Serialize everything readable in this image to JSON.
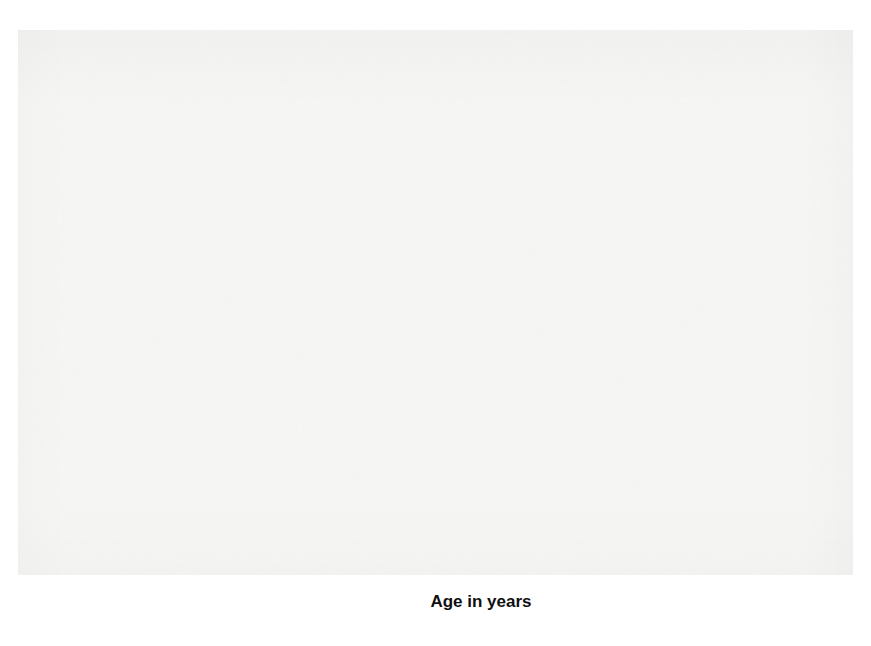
{
  "figure": {
    "background_color": "#f7f7f5",
    "page_color": "#ffffff"
  },
  "axes": {
    "y_title": "Adjusted Binet IQ",
    "x_title": "Age in years",
    "y_ticks": [
      "0",
      "100",
      "110",
      "120",
      "130",
      "140",
      "150",
      "160"
    ],
    "x_ticks": [
      "2",
      "3",
      "4",
      "5",
      "6",
      "7",
      "8",
      "9",
      "10",
      "11",
      "12",
      "13",
      "14",
      "15",
      "16",
      "17"
    ],
    "zero_break_label": "0",
    "gridline_color": "#a7a7a7",
    "axis_color": "#111111"
  },
  "legend": {
    "title": "Group",
    "entries": [
      {
        "label": "4",
        "color": "#555555"
      },
      {
        "label": "5",
        "color": "#8a8a8a"
      },
      {
        "label": "1",
        "color": "#c2c2c2"
      },
      {
        "label": "3",
        "color": "#949494"
      },
      {
        "label": "2",
        "color": "#6e6e6e"
      }
    ]
  },
  "chart_data": {
    "type": "line",
    "title": "",
    "xlabel": "Age in years",
    "ylabel": "Adjusted Binet IQ",
    "xlim": [
      1.6,
      17.4
    ],
    "ylim": [
      96,
      164
    ],
    "grid": true,
    "legend_position": "right",
    "x": [
      2.5,
      3,
      3.5,
      4,
      4.5,
      5,
      5.5,
      6,
      6.5,
      7,
      8,
      9,
      10,
      11,
      12,
      13,
      14,
      15,
      16,
      17
    ],
    "series": [
      {
        "name": "4",
        "label": "4",
        "color": "#555555",
        "x": [
          2.5,
          3,
          3.5,
          4,
          4.5,
          5,
          5.5,
          6,
          6.5,
          7,
          8,
          9,
          10,
          11,
          12,
          13,
          14,
          15,
          16,
          17
        ],
        "values": [
          130,
          134,
          135,
          137.5,
          139.5,
          141,
          136,
          139,
          145.5,
          148,
          154,
          152,
          160,
          154.5,
          150,
          145.5,
          140.5,
          139,
          136.5,
          134
        ]
      },
      {
        "name": "5",
        "label": "5",
        "color": "#8a8a8a",
        "x": [
          2.5,
          3,
          3.5,
          4,
          4.5,
          5,
          5.5,
          6,
          6.5,
          7,
          8,
          9,
          10,
          11,
          12,
          13,
          14,
          15,
          16,
          17
        ],
        "values": [
          112,
          129,
          126.5,
          122.5,
          131,
          121.5,
          128.5,
          126,
          128.5,
          131.5,
          136.5,
          138.5,
          138,
          142.5,
          138,
          137.5,
          137,
          128.5,
          128.5,
          129
        ]
      },
      {
        "name": "1",
        "label": "1",
        "color": "#c2c2c2",
        "x": [
          2.5,
          3,
          3.5,
          4,
          4.5,
          5,
          5.5,
          6,
          6.5,
          7,
          8,
          9,
          10,
          11,
          12,
          13,
          14,
          15,
          16,
          17
        ],
        "values": [
          112,
          128.5,
          128.5,
          124,
          118.5,
          113,
          114,
          111,
          115.5,
          118,
          120.5,
          121,
          124.5,
          122.5,
          124,
          122.5,
          120,
          117.5,
          113,
          107
        ]
      },
      {
        "name": "3",
        "label": "3",
        "color": "#949494",
        "x": [
          2.5,
          3,
          3.5,
          4,
          4.5,
          5,
          5.5,
          6,
          6.5,
          7,
          8,
          9,
          10,
          11,
          12,
          13,
          14,
          15,
          16,
          17
        ],
        "values": [
          111,
          113.5,
          117,
          114.5,
          114,
          114.5,
          115,
          115,
          115,
          115,
          116,
          116.5,
          117.5,
          115,
          117.5,
          117,
          116,
          118.5,
          120.5,
          123
        ]
      },
      {
        "name": "2",
        "label": "2",
        "color": "#6e6e6e",
        "x": [
          2.5,
          3,
          3.5,
          4,
          4.5,
          5,
          5.5,
          6,
          6.5,
          7,
          8,
          9,
          10,
          11,
          12,
          13,
          14,
          15,
          16,
          17
        ],
        "values": [
          110,
          112.5,
          114.5,
          114.5,
          114,
          114.5,
          113.5,
          102,
          100.5,
          100,
          101.5,
          100.5,
          106.5,
          100,
          104.5,
          104,
          103.5,
          108,
          110.5,
          113.5
        ]
      }
    ]
  }
}
